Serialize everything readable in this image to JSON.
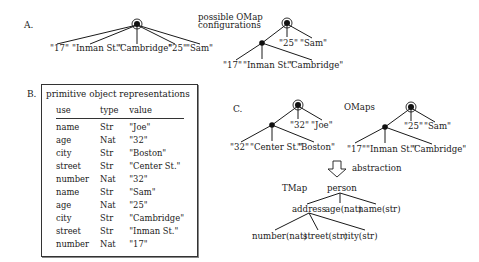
{
  "panel_a": {
    "label": "A.",
    "flat_tree_leaves": [
      "\"17\"",
      "\"Inman St.\"",
      "\"Cambridge\"",
      "\"25\"",
      "\"Sam\""
    ],
    "caption": [
      "possible OMap",
      "configurations"
    ],
    "nested_tree": {
      "root_leaves": [
        "\"25\"",
        "\"Sam\""
      ],
      "child_leaves": [
        "\"17\"",
        "\"Inman St.\"",
        "\"Cambridge\""
      ]
    }
  },
  "panel_b": {
    "label": "B.",
    "title": "primitive object representations",
    "columns": [
      "use",
      "type",
      "value"
    ],
    "rows": [
      [
        "name",
        "Str",
        "\"Joe\""
      ],
      [
        "age",
        "Nat",
        "\"32\""
      ],
      [
        "city",
        "Str",
        "\"Boston\""
      ],
      [
        "street",
        "Str",
        "\"Center St.\""
      ],
      [
        "number",
        "Nat",
        "\"32\""
      ],
      [
        "name",
        "Str",
        "\"Sam\""
      ],
      [
        "age",
        "Nat",
        "\"25\""
      ],
      [
        "city",
        "Str",
        "\"Cambridge\""
      ],
      [
        "street",
        "Str",
        "\"Inman St.\""
      ],
      [
        "number",
        "Nat",
        "\"17\""
      ]
    ]
  },
  "panel_c": {
    "label": "C.",
    "omaps_label": "OMaps",
    "omap_left": {
      "root_leaves": [
        "\"32\"",
        "\"Joe\""
      ],
      "child_leaves": [
        "\"32\"",
        "\"Center St.\"",
        "\"Boston\""
      ]
    },
    "omap_right": {
      "root_leaves": [
        "\"25\"",
        "\"Sam\""
      ],
      "child_leaves": [
        "\"17\"",
        "\"Inman St.\"",
        "\"Cambridge\""
      ]
    },
    "arrow_label": "abstraction",
    "tmap_label": "TMap",
    "tmap": {
      "root": "person",
      "level1": [
        "address",
        "age(nat)",
        "name(str)"
      ],
      "level2": [
        "number(nat)",
        "street(str)",
        "city(str)"
      ]
    }
  }
}
